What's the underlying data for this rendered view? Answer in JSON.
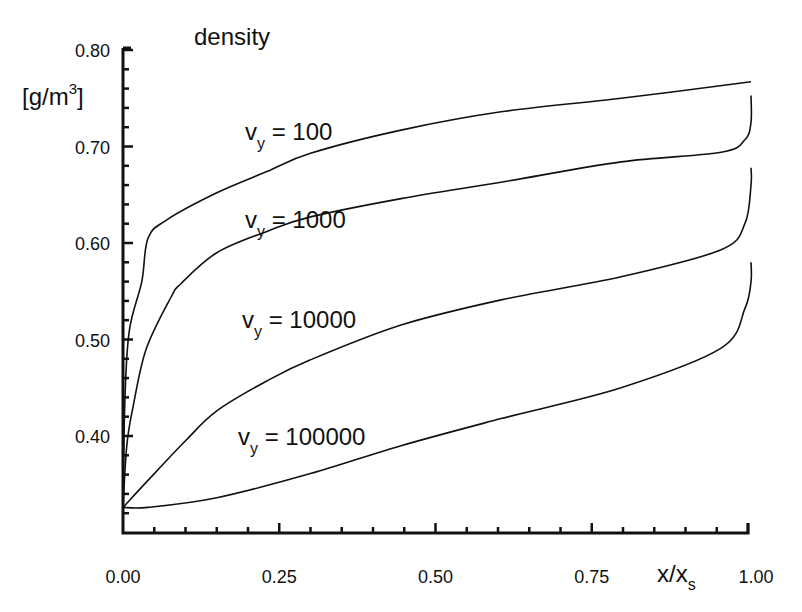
{
  "chart_data": {
    "type": "line",
    "title": "density",
    "ylabel": "[g/m3]",
    "ylabel_parts": {
      "main": "[g/m",
      "sup": "3",
      "close": "]"
    },
    "xlabel": "x/x_s",
    "xlabel_parts": {
      "main": "x/x",
      "sub": "s"
    },
    "xlim": [
      0.0,
      1.0
    ],
    "ylim": [
      0.3,
      0.8
    ],
    "x_ticks": [
      {
        "value": 0.0,
        "label": "0.00"
      },
      {
        "value": 0.25,
        "label": "0.25"
      },
      {
        "value": 0.5,
        "label": "0.50"
      },
      {
        "value": 0.75,
        "label": "0.75"
      },
      {
        "value": 1.0,
        "label": "1.00"
      }
    ],
    "y_ticks": [
      {
        "value": 0.4,
        "label": "0.40"
      },
      {
        "value": 0.5,
        "label": "0.50"
      },
      {
        "value": 0.6,
        "label": "0.60"
      },
      {
        "value": 0.7,
        "label": "0.70"
      },
      {
        "value": 0.8,
        "label": "0.80"
      }
    ],
    "x_minor_step": 0.05,
    "y_minor_step": 0.02,
    "grid": false,
    "legend": "inline labels",
    "series": [
      {
        "name": "v_y = 100",
        "label_parts": {
          "v": "v",
          "sub": "y",
          "rest": " = 100"
        },
        "label_pos": {
          "x": 245,
          "y": 140
        },
        "x": [
          0.0,
          0.003,
          0.01,
          0.03,
          0.04,
          0.07,
          0.15,
          0.23,
          0.3,
          0.445,
          0.605,
          0.797,
          1.0
        ],
        "values": [
          0.326,
          0.437,
          0.509,
          0.56,
          0.605,
          0.624,
          0.652,
          0.674,
          0.693,
          0.717,
          0.736,
          0.75,
          0.767
        ]
      },
      {
        "name": "v_y = 1000",
        "label_parts": {
          "v": "v",
          "sub": "y",
          "rest": " = 1000"
        },
        "label_pos": {
          "x": 245,
          "y": 228
        },
        "x": [
          0.0,
          0.006,
          0.016,
          0.037,
          0.077,
          0.093,
          0.15,
          0.23,
          0.3,
          0.445,
          0.605,
          0.797,
          0.957,
          0.995,
          1.0,
          1.0
        ],
        "values": [
          0.326,
          0.39,
          0.43,
          0.49,
          0.544,
          0.558,
          0.59,
          0.612,
          0.627,
          0.646,
          0.663,
          0.684,
          0.694,
          0.707,
          0.725,
          0.753
        ]
      },
      {
        "name": "v_y = 10000",
        "label_parts": {
          "v": "v",
          "sub": "y",
          "rest": " = 10000"
        },
        "label_pos": {
          "x": 242,
          "y": 328
        },
        "x": [
          0.0,
          0.04,
          0.1,
          0.15,
          0.23,
          0.3,
          0.445,
          0.605,
          0.797,
          0.957,
          0.995,
          1.0,
          1.0
        ],
        "values": [
          0.326,
          0.354,
          0.395,
          0.426,
          0.457,
          0.479,
          0.515,
          0.541,
          0.565,
          0.593,
          0.62,
          0.66,
          0.678
        ]
      },
      {
        "name": "v_y = 100000",
        "label_parts": {
          "v": "v",
          "sub": "y",
          "rest": " = 100000"
        },
        "label_pos": {
          "x": 238,
          "y": 445
        },
        "x": [
          0.0,
          0.04,
          0.15,
          0.3,
          0.445,
          0.605,
          0.797,
          0.957,
          0.995,
          1.0,
          1.0
        ],
        "values": [
          0.326,
          0.326,
          0.336,
          0.361,
          0.39,
          0.418,
          0.45,
          0.491,
          0.532,
          0.56,
          0.58
        ]
      }
    ]
  },
  "annotations": {
    "title": "density",
    "ylabel_main": "[g/m",
    "ylabel_sup": "3",
    "ylabel_close": "]",
    "xlabel_main": "x/x",
    "xlabel_sub": "s"
  },
  "colors": {
    "line": "#111111",
    "background": "#ffffff"
  }
}
